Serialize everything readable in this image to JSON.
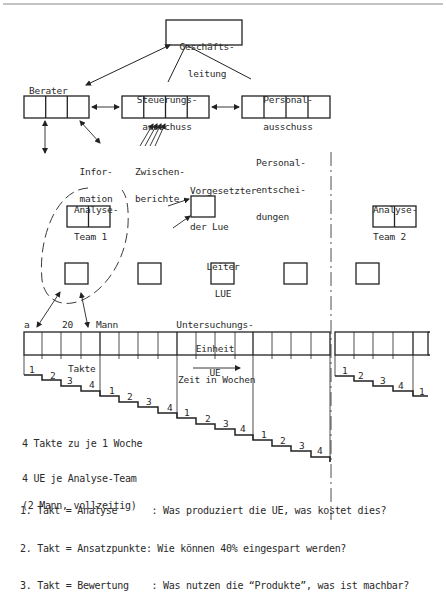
{
  "org": {
    "top_box": {
      "line1": "Geschäfts-",
      "line2": "leitung"
    },
    "berater": {
      "label": "Berater",
      "cells": 3
    },
    "steuerung": {
      "line1": "Steuerungs-",
      "line2": "ausschuss",
      "cells": 4
    },
    "personal": {
      "line1": "Personal-",
      "line2": "ausschuss",
      "cells": 4
    },
    "information": {
      "line1": "Infor-",
      "line2": "mation"
    },
    "zwischen": {
      "line1": "Zwischen-",
      "line2": "berichte"
    },
    "personalent": {
      "line1": "Personal-",
      "line2": "entschei-",
      "line3": "dungen"
    }
  },
  "teams": {
    "team1": {
      "line1": "Analyse-",
      "line2": "Team 1"
    },
    "team2": {
      "line1": "Analyse-",
      "line2": "Team 2"
    },
    "vorgesetzter": {
      "line1": "Vorgesetzter",
      "line2": "der Lue"
    },
    "leiter": {
      "line1": "Leiter",
      "line2": "LUE"
    }
  },
  "ue_bar": {
    "a_label": "a",
    "count_label": "20",
    "mann_label": "Mann",
    "title_line1": "Untersuchungs-",
    "title_line2": "Einheit",
    "title_line3": "UE",
    "takte_label": "Takte",
    "time_label": "Zeit in Wochen",
    "step_numbers": [
      "1",
      "2",
      "3",
      "4"
    ]
  },
  "legend": {
    "line1": "4 Takte zu je 1 Woche",
    "line2": "4 UE je Analyse-Team",
    "line3": "(2 Mann, vollzeitig)",
    "items": [
      {
        "num": "1. Takt",
        "name": "= Analyse      ",
        "desc": ": Was produziert die UE, was kostet dies?"
      },
      {
        "num": "2. Takt",
        "name": "= Ansatzpunkte",
        "desc": ": Wie können 40% eingespart werden?"
      },
      {
        "num": "3. Takt",
        "name": "= Bewertung    ",
        "desc": ": Was nutzen die “Produkte”, was ist machbar?"
      }
    ]
  }
}
